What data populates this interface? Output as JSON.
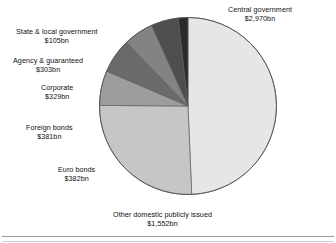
{
  "chart_data": {
    "type": "pie",
    "title": "",
    "unit": "bn",
    "currency": "$",
    "total": 6022,
    "start_angle_deg": 0,
    "direction": "clockwise",
    "legend": "none (direct labels)",
    "grid": false,
    "categories": [
      "Central government",
      "Other domestic publicly issued",
      "Euro bonds",
      "Foreign  bonds",
      "Corporate",
      "Agency & guaranteed",
      "State & local government"
    ],
    "values": [
      2970,
      1552,
      382,
      381,
      329,
      303,
      105
    ],
    "value_labels": [
      "$2,970bn",
      "$1,552bn",
      "$382bn",
      "$381bn",
      "$329bn",
      "$303bn",
      "$105bn"
    ],
    "colors": [
      "#e6e6e6",
      "#c6c6c6",
      "#9d9d9d",
      "#6a6a6a",
      "#838383",
      "#4e4e4e",
      "#2b2b2b"
    ],
    "slices": [
      {
        "label": "Central government",
        "value_label": "$2,970bn",
        "value": 2970,
        "color": "#e6e6e6",
        "start_deg": 0.0,
        "sweep_deg": 177.6
      },
      {
        "label": "Other domestic publicly issued",
        "value_label": "$1,552bn",
        "value": 1552,
        "color": "#c6c6c6",
        "start_deg": 177.6,
        "sweep_deg": 92.8
      },
      {
        "label": "Euro bonds",
        "value_label": "$382bn",
        "value": 382,
        "color": "#9d9d9d",
        "start_deg": 270.4,
        "sweep_deg": 22.8
      },
      {
        "label": "Foreign  bonds",
        "value_label": "$381bn",
        "value": 381,
        "color": "#6a6a6a",
        "start_deg": 293.2,
        "sweep_deg": 22.8
      },
      {
        "label": "Corporate",
        "value_label": "$329bn",
        "value": 329,
        "color": "#838383",
        "start_deg": 316.0,
        "sweep_deg": 19.7
      },
      {
        "label": "Agency & guaranteed",
        "value_label": "$303bn",
        "value": 303,
        "color": "#4e4e4e",
        "start_deg": 335.7,
        "sweep_deg": 18.1
      },
      {
        "label": "State & local government",
        "value_label": "$105bn",
        "value": 105,
        "color": "#2b2b2b",
        "start_deg": 353.7,
        "sweep_deg": 6.3
      }
    ]
  },
  "labels": {
    "central_government": {
      "title": "Central government",
      "value": "$2,970bn"
    },
    "state_local": {
      "title": "State & local government",
      "value": "$105bn"
    },
    "agency": {
      "title": "Agency & guaranteed",
      "value": "$303bn"
    },
    "corporate": {
      "title": "Corporate",
      "value": "$329bn"
    },
    "foreign_bonds": {
      "title": "Foreign  bonds",
      "value": "$381bn"
    },
    "euro_bonds": {
      "title": "Euro bonds",
      "value": "$382bn"
    },
    "other_domestic": {
      "title": "Other domestic publicly issued",
      "value": "$1,552bn"
    }
  }
}
